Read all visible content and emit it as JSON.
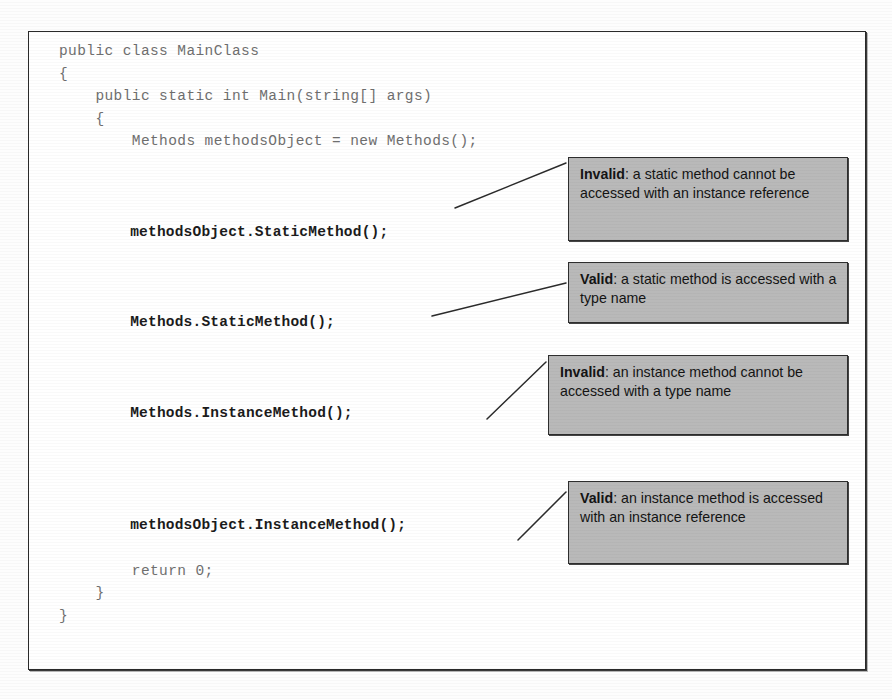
{
  "figure": {
    "language": "C#",
    "code_lines": [
      {
        "text": "public class MainClass",
        "emphasis": false
      },
      {
        "text": "{",
        "emphasis": false
      },
      {
        "text": "    public static int Main(string[] args)",
        "emphasis": false
      },
      {
        "text": "    {",
        "emphasis": false
      },
      {
        "text": "        Methods methodsObject = new Methods();",
        "emphasis": false
      },
      {
        "text": "",
        "emphasis": false
      },
      {
        "text": "",
        "emphasis": false
      },
      {
        "text": "",
        "emphasis": false
      },
      {
        "text": "        methodsObject.StaticMethod();",
        "emphasis": true
      },
      {
        "text": "",
        "emphasis": false
      },
      {
        "text": "",
        "emphasis": false
      },
      {
        "text": "",
        "emphasis": false
      },
      {
        "text": "        Methods.StaticMethod();",
        "emphasis": true
      },
      {
        "text": "",
        "emphasis": false
      },
      {
        "text": "",
        "emphasis": false
      },
      {
        "text": "",
        "emphasis": false
      },
      {
        "text": "        Methods.InstanceMethod();",
        "emphasis": true
      },
      {
        "text": "",
        "emphasis": false
      },
      {
        "text": "",
        "emphasis": false
      },
      {
        "text": "",
        "emphasis": false
      },
      {
        "text": "",
        "emphasis": false
      },
      {
        "text": "        methodsObject.InstanceMethod();",
        "emphasis": true
      },
      {
        "text": "",
        "emphasis": false
      },
      {
        "text": "        return 0;",
        "emphasis": false
      },
      {
        "text": "    }",
        "emphasis": false
      },
      {
        "text": "}",
        "emphasis": false
      },
      {
        "text": "",
        "emphasis": false
      }
    ],
    "closing_brace": "}",
    "callouts": [
      {
        "id": "callout-1",
        "lead": "Invalid",
        "separator": ": ",
        "text": "a static method cannot be accessed with an instance reference",
        "targets_line": "methodsObject.StaticMethod();"
      },
      {
        "id": "callout-2",
        "lead": "Valid",
        "separator": ": ",
        "text": "a static method is accessed with a type name",
        "targets_line": "Methods.StaticMethod();"
      },
      {
        "id": "callout-3",
        "lead": "Invalid",
        "separator": ": ",
        "text": "an instance method cannot be accessed with a type name",
        "targets_line": "Methods.InstanceMethod();"
      },
      {
        "id": "callout-4",
        "lead": "Valid",
        "separator": ": ",
        "text": "an instance method is accessed with an instance reference",
        "targets_line": "methodsObject.InstanceMethod();"
      }
    ],
    "colors": {
      "callout_fill": "#b9b9b9",
      "callout_border": "#2e2e2e",
      "frame_border": "#2a2a2a",
      "code_text": "#6f6f6f",
      "emphasis_text": "#1b1b1b",
      "page_background": "#ffffff"
    }
  }
}
